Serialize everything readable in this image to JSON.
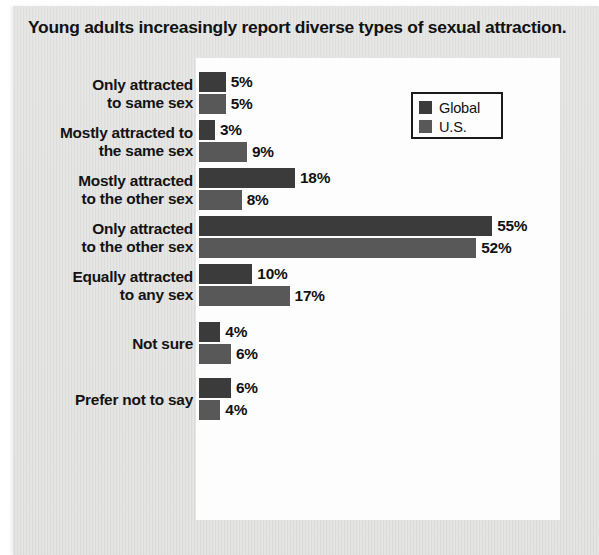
{
  "title": "Young adults increasingly report diverse types of sexual attraction.",
  "legend": {
    "position": "top-right",
    "entries": [
      {
        "label": "Global",
        "color": "#3b3b3b",
        "swatch": "legend-swatch-global"
      },
      {
        "label": "U.S.",
        "color": "#585858",
        "swatch": "legend-swatch-us"
      }
    ]
  },
  "colors": {
    "global_bar": "#3b3b3b",
    "us_bar": "#585858",
    "card_background": "#dedede",
    "plot_background": "#fdfdfd",
    "text": "#121212"
  },
  "chart_data": {
    "type": "bar",
    "orientation": "horizontal",
    "title": "Young adults increasingly report diverse types of sexual attraction.",
    "xlabel": "",
    "ylabel": "",
    "grid": false,
    "legend_position": "top-right",
    "value_suffix": "%",
    "xlim": [
      0,
      60
    ],
    "categories": [
      "Only attracted to same sex",
      "Mostly attracted to the same sex",
      "Mostly attracted to the other sex",
      "Only attracted to the other sex",
      "Equally attracted to any sex",
      "Not sure",
      "Prefer not to say"
    ],
    "category_lines": [
      [
        "Only attracted",
        "to same sex"
      ],
      [
        "Mostly attracted to",
        "the same sex"
      ],
      [
        "Mostly attracted",
        "to the other sex"
      ],
      [
        "Only attracted",
        "to the other sex"
      ],
      [
        "Equally attracted",
        "to any sex"
      ],
      [
        "Not sure"
      ],
      [
        "Prefer not to say"
      ]
    ],
    "series": [
      {
        "name": "Global",
        "values": [
          5,
          3,
          18,
          55,
          10,
          4,
          6
        ],
        "labels": [
          "5%",
          "3%",
          "18%",
          "55%",
          "10%",
          "4%",
          "6%"
        ]
      },
      {
        "name": "U.S.",
        "values": [
          5,
          9,
          8,
          52,
          17,
          6,
          4
        ],
        "labels": [
          "5%",
          "9%",
          "8%",
          "52%",
          "17%",
          "6%",
          "4%"
        ]
      }
    ]
  }
}
